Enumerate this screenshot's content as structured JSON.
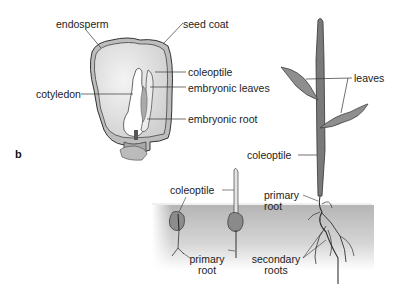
{
  "figure": {
    "panel_label": "b"
  },
  "seed_section": {
    "labels": {
      "endosperm": "endosperm",
      "seed_coat": "seed coat",
      "coleoptile": "coleoptile",
      "cotyledon": "cotyledon",
      "embryonic_leaves": "embryonic leaves",
      "embryonic_root": "embryonic root"
    }
  },
  "germination": {
    "stage1": {
      "coleoptile": "coleoptile",
      "primary_root_line1": "primary",
      "primary_root_line2": "root"
    },
    "stage3": {
      "coleoptile": "coleoptile",
      "leaves": "leaves",
      "primary_root_line1": "primary",
      "primary_root_line2": "root",
      "secondary_roots_line1": "secondary",
      "secondary_roots_line2": "roots"
    }
  },
  "colors": {
    "soil_gray": "#bdbdbd",
    "line": "#333333",
    "seed_fill": "#e6e6e6",
    "seed_coat": "#9a9a9a",
    "leaf": "#8a8a8a"
  }
}
